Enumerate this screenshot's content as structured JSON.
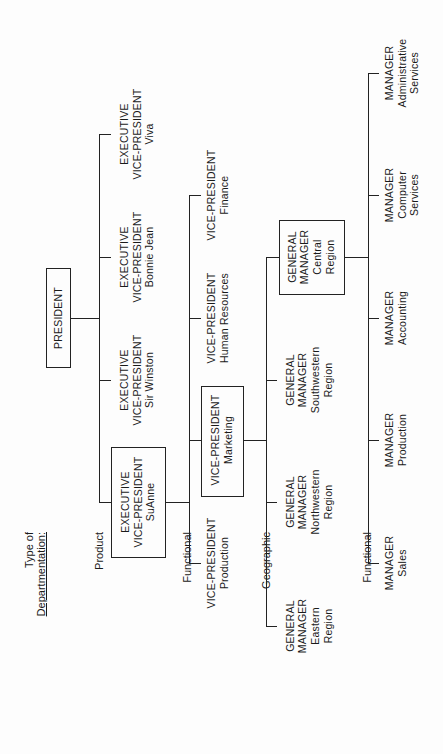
{
  "document": {
    "orientation": "rotated-90-ccw",
    "legend": {
      "title_line1": "Type of",
      "title_line2": "Departmentation:",
      "rows": [
        "Product",
        "Functional",
        "Geographic",
        "Functional"
      ]
    },
    "president": {
      "title": "PRESIDENT"
    },
    "product_level": [
      {
        "line1": "EXECUTIVE",
        "line2": "VICE-PRESIDENT",
        "line3": "SuAnne",
        "boxed": true
      },
      {
        "line1": "EXECUTIVE",
        "line2": "VICE-PRESIDENT",
        "line3": "Sir Winston",
        "boxed": false
      },
      {
        "line1": "EXECUTIVE",
        "line2": "VICE-PRESIDENT",
        "line3": "Bonnie Jean",
        "boxed": false
      },
      {
        "line1": "EXECUTIVE",
        "line2": "VICE-PRESIDENT",
        "line3": "Viva",
        "boxed": false
      }
    ],
    "functional_level": [
      {
        "line1": "VICE-PRESIDENT",
        "line2": "Production",
        "boxed": false
      },
      {
        "line1": "VICE-PRESIDENT",
        "line2": "Marketing",
        "boxed": true
      },
      {
        "line1": "VICE-PRESIDENT",
        "line2": "Human Resources",
        "boxed": false
      },
      {
        "line1": "VICE-PRESIDENT",
        "line2": "Finance",
        "boxed": false
      }
    ],
    "geographic_level": [
      {
        "line1": "GENERAL",
        "line2": "MANAGER",
        "line3": "Eastern",
        "line4": "Region",
        "boxed": false
      },
      {
        "line1": "GENERAL",
        "line2": "MANAGER",
        "line3": "Northwestern",
        "line4": "Region",
        "boxed": false
      },
      {
        "line1": "GENERAL",
        "line2": "MANAGER",
        "line3": "Southwestern",
        "line4": "Region",
        "boxed": false
      },
      {
        "line1": "GENERAL",
        "line2": "MANAGER",
        "line3": "Central",
        "line4": "Region",
        "boxed": true
      }
    ],
    "functional_level_2": [
      {
        "line1": "MANAGER",
        "line2": "Sales"
      },
      {
        "line1": "MANAGER",
        "line2": "Production"
      },
      {
        "line1": "MANAGER",
        "line2": "Accounting"
      },
      {
        "line1": "MANAGER",
        "line2": "Computer",
        "line3": "Services"
      },
      {
        "line1": "MANAGER",
        "line2": "Administrative",
        "line3": "Services"
      }
    ]
  }
}
